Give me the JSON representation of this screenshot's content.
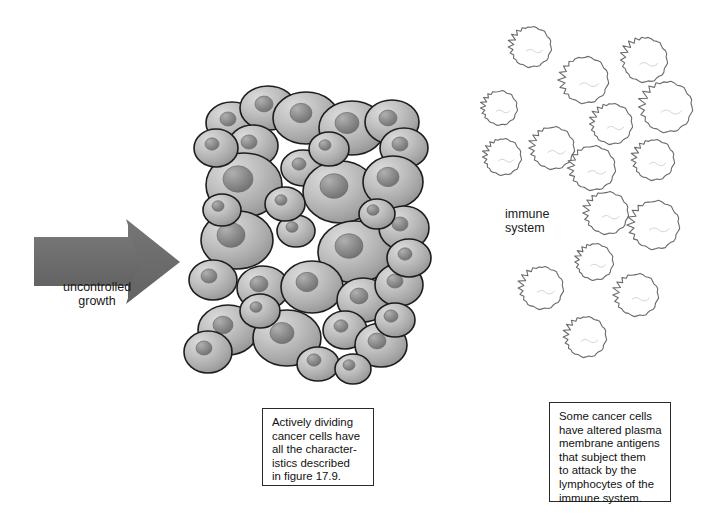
{
  "figure": {
    "background": "#ffffff"
  },
  "arrow": {
    "label": "uncontrolled\ngrowth",
    "color": "#6e6e6e",
    "direction": "right",
    "points_to": "tumor-cell-mass"
  },
  "tumor": {
    "name": "tumor-cell-mass",
    "cell_count": 35,
    "cell_fill_light": "#d2d2d2",
    "cell_fill_dark": "#9a9a9a",
    "nucleus_fill_light": "#a5a5a5",
    "nucleus_fill_dark": "#7b7b7b",
    "outline_color": "#1d1d1d",
    "cells": [
      {
        "cx": 232,
        "cy": 123,
        "rx": 26,
        "ry": 21,
        "nx": 228,
        "ny": 119,
        "nr": 8
      },
      {
        "cx": 268,
        "cy": 108,
        "rx": 28,
        "ry": 22,
        "nx": 264,
        "ny": 104,
        "nr": 9
      },
      {
        "cx": 306,
        "cy": 118,
        "rx": 33,
        "ry": 26,
        "nx": 301,
        "ny": 113,
        "nr": 11
      },
      {
        "cx": 352,
        "cy": 128,
        "rx": 33,
        "ry": 27,
        "nx": 347,
        "ny": 123,
        "nr": 12
      },
      {
        "cx": 392,
        "cy": 122,
        "rx": 27,
        "ry": 22,
        "nx": 388,
        "ny": 118,
        "nr": 9
      },
      {
        "cx": 253,
        "cy": 146,
        "rx": 25,
        "ry": 21,
        "nx": 249,
        "ny": 142,
        "nr": 8
      },
      {
        "cx": 404,
        "cy": 148,
        "rx": 24,
        "ry": 20,
        "nx": 400,
        "ny": 144,
        "nr": 8
      },
      {
        "cx": 244,
        "cy": 185,
        "rx": 38,
        "ry": 32,
        "nx": 238,
        "ny": 179,
        "nr": 15
      },
      {
        "cx": 303,
        "cy": 168,
        "rx": 22,
        "ry": 18,
        "nx": 299,
        "ny": 164,
        "nr": 7
      },
      {
        "cx": 340,
        "cy": 192,
        "rx": 37,
        "ry": 31,
        "nx": 334,
        "ny": 186,
        "nr": 14
      },
      {
        "cx": 393,
        "cy": 182,
        "rx": 30,
        "ry": 26,
        "nx": 388,
        "ny": 177,
        "nr": 11
      },
      {
        "cx": 237,
        "cy": 240,
        "rx": 36,
        "ry": 29,
        "nx": 231,
        "ny": 235,
        "nr": 14
      },
      {
        "cx": 296,
        "cy": 231,
        "rx": 19,
        "ry": 16,
        "nx": 292,
        "ny": 227,
        "nr": 6
      },
      {
        "cx": 355,
        "cy": 252,
        "rx": 37,
        "ry": 31,
        "nx": 349,
        "ny": 246,
        "nr": 14
      },
      {
        "cx": 404,
        "cy": 228,
        "rx": 25,
        "ry": 22,
        "nx": 400,
        "ny": 224,
        "nr": 8
      },
      {
        "cx": 213,
        "cy": 280,
        "rx": 24,
        "ry": 20,
        "nx": 209,
        "ny": 276,
        "nr": 8
      },
      {
        "cx": 263,
        "cy": 288,
        "rx": 26,
        "ry": 22,
        "nx": 259,
        "ny": 284,
        "nr": 9
      },
      {
        "cx": 312,
        "cy": 287,
        "rx": 31,
        "ry": 26,
        "nx": 307,
        "ny": 282,
        "nr": 11
      },
      {
        "cx": 363,
        "cy": 300,
        "rx": 26,
        "ry": 22,
        "nx": 359,
        "ny": 296,
        "nr": 9
      },
      {
        "cx": 399,
        "cy": 285,
        "rx": 24,
        "ry": 21,
        "nx": 395,
        "ny": 281,
        "nr": 8
      },
      {
        "cx": 228,
        "cy": 330,
        "rx": 30,
        "ry": 25,
        "nx": 223,
        "ny": 325,
        "nr": 10
      },
      {
        "cx": 287,
        "cy": 338,
        "rx": 34,
        "ry": 28,
        "nx": 282,
        "ny": 333,
        "nr": 12
      },
      {
        "cx": 208,
        "cy": 352,
        "rx": 24,
        "ry": 21,
        "nx": 204,
        "ny": 348,
        "nr": 8
      },
      {
        "cx": 345,
        "cy": 330,
        "rx": 22,
        "ry": 19,
        "nx": 341,
        "ny": 326,
        "nr": 7
      },
      {
        "cx": 381,
        "cy": 345,
        "rx": 26,
        "ry": 22,
        "nx": 377,
        "ny": 341,
        "nr": 9
      },
      {
        "cx": 395,
        "cy": 320,
        "rx": 20,
        "ry": 17,
        "nx": 391,
        "ny": 316,
        "nr": 7
      },
      {
        "cx": 216,
        "cy": 148,
        "rx": 22,
        "ry": 19,
        "nx": 212,
        "ny": 144,
        "nr": 7
      },
      {
        "cx": 285,
        "cy": 204,
        "rx": 20,
        "ry": 17,
        "nx": 281,
        "ny": 200,
        "nr": 6
      },
      {
        "cx": 409,
        "cy": 258,
        "rx": 22,
        "ry": 19,
        "nx": 405,
        "ny": 254,
        "nr": 7
      },
      {
        "cx": 329,
        "cy": 149,
        "rx": 20,
        "ry": 17,
        "nx": 325,
        "ny": 145,
        "nr": 6
      },
      {
        "cx": 260,
        "cy": 311,
        "rx": 20,
        "ry": 17,
        "nx": 256,
        "ny": 307,
        "nr": 6
      },
      {
        "cx": 222,
        "cy": 210,
        "rx": 19,
        "ry": 16,
        "nx": 218,
        "ny": 206,
        "nr": 6
      },
      {
        "cx": 377,
        "cy": 214,
        "rx": 18,
        "ry": 15,
        "nx": 373,
        "ny": 210,
        "nr": 6
      },
      {
        "cx": 318,
        "cy": 364,
        "rx": 21,
        "ry": 17,
        "nx": 314,
        "ny": 360,
        "nr": 7
      },
      {
        "cx": 353,
        "cy": 369,
        "rx": 18,
        "ry": 15,
        "nx": 349,
        "ny": 365,
        "nr": 6
      }
    ]
  },
  "immune": {
    "label": "immune\nsystem",
    "cell_count": 16,
    "outline_color": "#6a6a6a",
    "fill_color": "#ffffff",
    "lymphocytes": [
      {
        "cx": 531,
        "cy": 47,
        "r": 20,
        "rot": 200
      },
      {
        "cx": 645,
        "cy": 60,
        "r": 22,
        "rot": 210
      },
      {
        "cx": 585,
        "cy": 80,
        "r": 23,
        "rot": 185
      },
      {
        "cx": 500,
        "cy": 108,
        "r": 17,
        "rot": 195
      },
      {
        "cx": 667,
        "cy": 107,
        "r": 25,
        "rot": 200
      },
      {
        "cx": 612,
        "cy": 124,
        "r": 20,
        "rot": 205
      },
      {
        "cx": 503,
        "cy": 157,
        "r": 18,
        "rot": 200
      },
      {
        "cx": 553,
        "cy": 148,
        "r": 21,
        "rot": 195
      },
      {
        "cx": 593,
        "cy": 168,
        "r": 22,
        "rot": 190
      },
      {
        "cx": 654,
        "cy": 160,
        "r": 20,
        "rot": 200
      },
      {
        "cx": 607,
        "cy": 213,
        "r": 21,
        "rot": 195
      },
      {
        "cx": 655,
        "cy": 225,
        "r": 24,
        "rot": 190
      },
      {
        "cx": 595,
        "cy": 262,
        "r": 18,
        "rot": 205
      },
      {
        "cx": 542,
        "cy": 288,
        "r": 21,
        "rot": 200
      },
      {
        "cx": 637,
        "cy": 295,
        "r": 21,
        "rot": 195
      },
      {
        "cx": 586,
        "cy": 337,
        "r": 20,
        "rot": 200
      }
    ]
  },
  "captions": {
    "tumor": "Actively dividing\ncancer cells have\nall the character-\nistics described\nin figure 17.9.",
    "immune": "Some cancer cells\nhave altered plasma\nmembrane antigens\nthat subject them\nto attack by the\nlymphocytes of the\nimmune system."
  }
}
